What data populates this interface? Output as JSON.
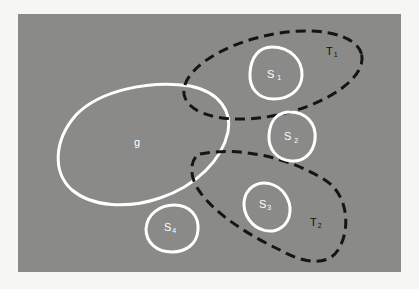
{
  "diagram": {
    "background": "#f6f6f4",
    "panel": {
      "color": "#8a8a88",
      "x": 18,
      "y": 14,
      "width": 383,
      "height": 258
    },
    "colors": {
      "solid_outline": "#ffffff",
      "dashed_outline": "#151515",
      "solid_label": "#ffffff",
      "dashed_label": "#111111"
    },
    "sets": [
      {
        "id": "g",
        "label": "g",
        "subscript": "",
        "style": "solid"
      },
      {
        "id": "S1",
        "label": "S",
        "subscript": "1",
        "style": "solid"
      },
      {
        "id": "S2",
        "label": "S",
        "subscript": "2",
        "style": "solid"
      },
      {
        "id": "S3",
        "label": "S",
        "subscript": "3",
        "style": "solid"
      },
      {
        "id": "S4",
        "label": "S",
        "subscript": "4",
        "style": "solid"
      },
      {
        "id": "T1",
        "label": "T",
        "subscript": "1",
        "style": "dashed"
      },
      {
        "id": "T2",
        "label": "T",
        "subscript": "2",
        "style": "dashed"
      }
    ],
    "relations": [
      {
        "outer": "T1",
        "contains": [
          "S1"
        ]
      },
      {
        "outer": "T2",
        "contains": [
          "S3"
        ]
      },
      {
        "overlaps": [
          "T1",
          "g"
        ]
      },
      {
        "overlaps": [
          "T2",
          "g"
        ]
      },
      {
        "overlaps": [
          "T1",
          "S2"
        ]
      },
      {
        "overlaps": [
          "T2",
          "S2"
        ]
      }
    ]
  }
}
